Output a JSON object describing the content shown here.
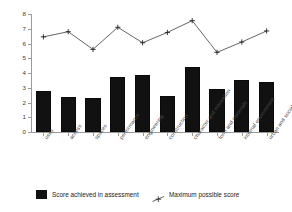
{
  "chart_data": {
    "type": "bar",
    "title": "",
    "xlabel": "",
    "ylabel": "",
    "ylim": [
      0,
      8
    ],
    "yticks": [
      0,
      1,
      2,
      3,
      4,
      5,
      6,
      7,
      8
    ],
    "ytick_labels": [
      "0",
      "1",
      "2",
      "3",
      "4",
      "5",
      "6",
      "7",
      "8"
    ],
    "grid": false,
    "legend_position": "bottom",
    "categories": [
      "uses",
      "access",
      "spaces",
      "performance",
      "engineering",
      "construction",
      "character and innovation",
      "form and materials",
      "internal environment",
      "urban and social integration"
    ],
    "series": [
      {
        "name": "Score achieved in assessment",
        "type": "bar",
        "color": "#111111",
        "values": [
          2.8,
          2.4,
          2.3,
          3.75,
          3.85,
          2.45,
          4.4,
          2.9,
          3.55,
          3.4
        ]
      },
      {
        "name": "Maximum possible score",
        "type": "line",
        "color": "#222222",
        "marker": "plus",
        "values": [
          6.45,
          6.8,
          5.6,
          7.1,
          6.05,
          6.75,
          7.55,
          5.4,
          6.1,
          6.85
        ]
      }
    ]
  },
  "legend": {
    "bar_label": "Score achieved in assessment",
    "line_label": "Maximum possible score",
    "bar_swatch_color": "#111111",
    "line_marker_icon": "plus-marker-icon"
  }
}
